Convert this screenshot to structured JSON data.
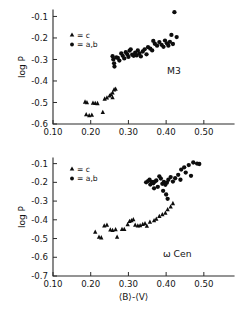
{
  "figure": {
    "name": "log-P-versus-B-V-two-panel-scatter",
    "xlabel": "⟨B⟩-⟨V⟩",
    "legend": {
      "triangle_label": "= c",
      "circle_label": "= a,b",
      "triangle_marker": "triangle-marker-icon",
      "circle_marker": "circle-marker-icon"
    },
    "colors": {
      "marker": "#0d0d0d",
      "axis": "#2b2b2b",
      "background": "#ffffff"
    }
  },
  "chart_data": [
    {
      "type": "scatter",
      "title": "M3",
      "xlabel": "",
      "ylabel": "log P",
      "xlim": [
        0.1,
        0.58
      ],
      "ylim": [
        -0.6,
        -0.07
      ],
      "xticks": [
        0.1,
        0.2,
        0.3,
        0.4,
        0.5
      ],
      "xticklabels": [
        "0.10",
        "0.20",
        "0.30",
        "0.40",
        "0.50"
      ],
      "yticks": [
        -0.1,
        -0.2,
        -0.3,
        -0.4,
        -0.5,
        -0.6
      ],
      "yticklabels": [
        "-0.1",
        "-0.2",
        "-0.3",
        "-0.4",
        "-0.5",
        "-0.6"
      ],
      "grid": false,
      "legend_position": "upper-left-inside",
      "series": [
        {
          "name": "c",
          "marker": "triangle",
          "points": [
            [
              0.185,
              -0.497
            ],
            [
              0.19,
              -0.5
            ],
            [
              0.188,
              -0.556
            ],
            [
              0.196,
              -0.56
            ],
            [
              0.203,
              -0.558
            ],
            [
              0.206,
              -0.502
            ],
            [
              0.212,
              -0.503
            ],
            [
              0.218,
              -0.504
            ],
            [
              0.232,
              -0.545
            ],
            [
              0.237,
              -0.483
            ],
            [
              0.243,
              -0.478
            ],
            [
              0.25,
              -0.468
            ],
            [
              0.254,
              -0.463
            ],
            [
              0.258,
              -0.455
            ],
            [
              0.262,
              -0.44
            ],
            [
              0.266,
              -0.437
            ],
            [
              0.258,
              -0.477
            ]
          ]
        },
        {
          "name": "a,b",
          "marker": "circle",
          "points": [
            [
              0.258,
              -0.285
            ],
            [
              0.26,
              -0.3
            ],
            [
              0.262,
              -0.318
            ],
            [
              0.263,
              -0.333
            ],
            [
              0.268,
              -0.29
            ],
            [
              0.272,
              -0.293
            ],
            [
              0.276,
              -0.305
            ],
            [
              0.281,
              -0.272
            ],
            [
              0.285,
              -0.283
            ],
            [
              0.289,
              -0.295
            ],
            [
              0.293,
              -0.266
            ],
            [
              0.297,
              -0.276
            ],
            [
              0.3,
              -0.288
            ],
            [
              0.303,
              -0.259
            ],
            [
              0.306,
              -0.253
            ],
            [
              0.31,
              -0.278
            ],
            [
              0.314,
              -0.283
            ],
            [
              0.318,
              -0.268
            ],
            [
              0.322,
              -0.281
            ],
            [
              0.325,
              -0.258
            ],
            [
              0.329,
              -0.272
            ],
            [
              0.333,
              -0.286
            ],
            [
              0.338,
              -0.263
            ],
            [
              0.343,
              -0.253
            ],
            [
              0.348,
              -0.276
            ],
            [
              0.352,
              -0.243
            ],
            [
              0.358,
              -0.25
            ],
            [
              0.363,
              -0.258
            ],
            [
              0.37,
              -0.227
            ],
            [
              0.376,
              -0.236
            ],
            [
              0.382,
              -0.219
            ],
            [
              0.388,
              -0.232
            ],
            [
              0.393,
              -0.241
            ],
            [
              0.397,
              -0.212
            ],
            [
              0.402,
              -0.225
            ],
            [
              0.406,
              -0.236
            ],
            [
              0.41,
              -0.218
            ],
            [
              0.414,
              -0.186
            ],
            [
              0.418,
              -0.228
            ],
            [
              0.422,
              -0.08
            ],
            [
              0.428,
              -0.196
            ],
            [
              0.366,
              -0.214
            ]
          ]
        }
      ]
    },
    {
      "type": "scatter",
      "title": "ω Cen",
      "xlabel": "⟨B⟩-⟨V⟩",
      "ylabel": "log P",
      "xlim": [
        0.1,
        0.58
      ],
      "ylim": [
        -0.7,
        -0.07
      ],
      "xticks": [
        0.1,
        0.2,
        0.3,
        0.4,
        0.5
      ],
      "xticklabels": [
        "0.10",
        "0.20",
        "0.30",
        "0.40",
        "0.50"
      ],
      "yticks": [
        -0.1,
        -0.2,
        -0.3,
        -0.4,
        -0.5,
        -0.6,
        -0.7
      ],
      "yticklabels": [
        "-0.1",
        "-0.2",
        "-0.3",
        "-0.4",
        "-0.5",
        "-0.6",
        "-0.7"
      ],
      "grid": false,
      "legend_position": "upper-left-inside",
      "series": [
        {
          "name": "c",
          "marker": "triangle",
          "points": [
            [
              0.212,
              -0.465
            ],
            [
              0.222,
              -0.492
            ],
            [
              0.228,
              -0.495
            ],
            [
              0.236,
              -0.432
            ],
            [
              0.243,
              -0.428
            ],
            [
              0.252,
              -0.453
            ],
            [
              0.258,
              -0.455
            ],
            [
              0.266,
              -0.452
            ],
            [
              0.27,
              -0.492
            ],
            [
              0.283,
              -0.45
            ],
            [
              0.289,
              -0.45
            ],
            [
              0.298,
              -0.425
            ],
            [
              0.303,
              -0.408
            ],
            [
              0.308,
              -0.403
            ],
            [
              0.313,
              -0.398
            ],
            [
              0.318,
              -0.428
            ],
            [
              0.325,
              -0.432
            ],
            [
              0.331,
              -0.43
            ],
            [
              0.338,
              -0.424
            ],
            [
              0.344,
              -0.42
            ],
            [
              0.349,
              -0.433
            ],
            [
              0.357,
              -0.412
            ],
            [
              0.368,
              -0.404
            ],
            [
              0.374,
              -0.395
            ],
            [
              0.382,
              -0.381
            ],
            [
              0.39,
              -0.372
            ],
            [
              0.398,
              -0.363
            ],
            [
              0.404,
              -0.345
            ],
            [
              0.412,
              -0.33
            ],
            [
              0.418,
              -0.312
            ]
          ]
        },
        {
          "name": "a,b",
          "marker": "circle",
          "points": [
            [
              0.347,
              -0.2
            ],
            [
              0.352,
              -0.193
            ],
            [
              0.356,
              -0.186
            ],
            [
              0.358,
              -0.212
            ],
            [
              0.362,
              -0.198
            ],
            [
              0.366,
              -0.205
            ],
            [
              0.37,
              -0.196
            ],
            [
              0.374,
              -0.19
            ],
            [
              0.368,
              -0.232
            ],
            [
              0.378,
              -0.224
            ],
            [
              0.382,
              -0.168
            ],
            [
              0.386,
              -0.18
            ],
            [
              0.39,
              -0.208
            ],
            [
              0.394,
              -0.198
            ],
            [
              0.398,
              -0.213
            ],
            [
              0.402,
              -0.202
            ],
            [
              0.406,
              -0.186
            ],
            [
              0.392,
              -0.245
            ],
            [
              0.4,
              -0.265
            ],
            [
              0.404,
              -0.288
            ],
            [
              0.412,
              -0.172
            ],
            [
              0.418,
              -0.196
            ],
            [
              0.424,
              -0.178
            ],
            [
              0.432,
              -0.16
            ],
            [
              0.44,
              -0.132
            ],
            [
              0.448,
              -0.12
            ],
            [
              0.452,
              -0.148
            ],
            [
              0.46,
              -0.108
            ],
            [
              0.466,
              -0.165
            ],
            [
              0.472,
              -0.094
            ],
            [
              0.482,
              -0.1
            ],
            [
              0.488,
              -0.102
            ],
            [
              0.438,
              -0.186
            ]
          ]
        }
      ]
    }
  ]
}
